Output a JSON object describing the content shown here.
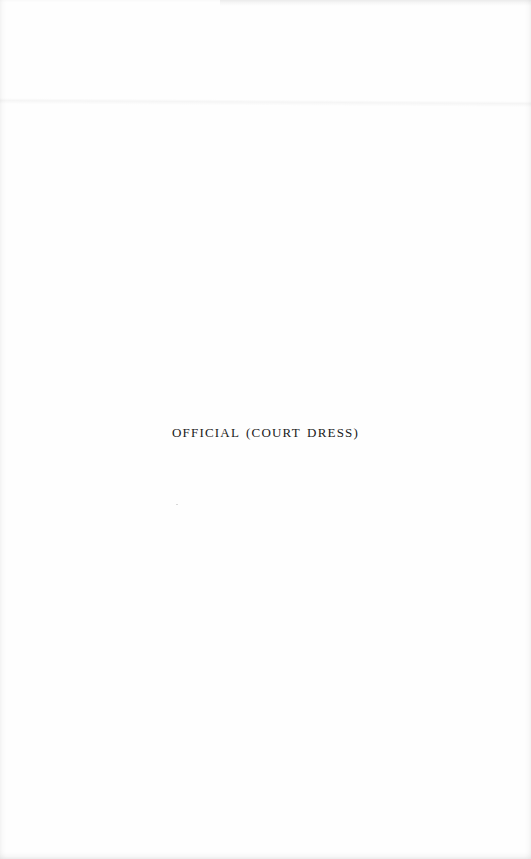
{
  "page": {
    "caption": "OFFICIAL (COURT DRESS)"
  }
}
